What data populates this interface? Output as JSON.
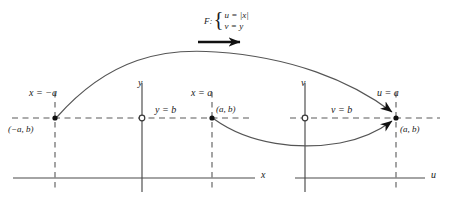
{
  "figure": {
    "colors": {
      "ink": "#1a1a1a",
      "axis": "#4a4a4a",
      "curve": "#555555",
      "dashed": "#5a5a5a",
      "background": "#ffffff"
    },
    "function_label": {
      "name": "F:",
      "equation_1": "u = |x|",
      "equation_2": "v = y",
      "arrow": "rightwards-arrow"
    },
    "source_plane": {
      "horizontal_axis_label": "x",
      "vertical_axis_label": "y",
      "horizontal_guide_label": "y = b",
      "left_vertical_guide_label": "x = −a",
      "right_vertical_guide_label": "x = a",
      "left_point_label": "(−a, b)",
      "right_point_label": "(a, b)"
    },
    "target_plane": {
      "horizontal_axis_label": "u",
      "vertical_axis_label": "v",
      "horizontal_guide_label": "v = b",
      "vertical_guide_label": "u = a",
      "point_label": "(a, b)"
    }
  }
}
